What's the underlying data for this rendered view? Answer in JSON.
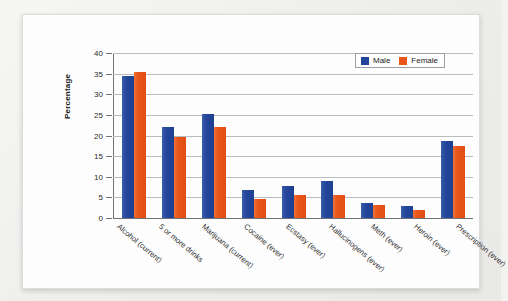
{
  "chart_data": {
    "type": "bar",
    "title": "",
    "xlabel": "",
    "ylabel": "Percentage",
    "ylim": [
      0,
      40
    ],
    "yticks": [
      0,
      5,
      10,
      15,
      20,
      25,
      30,
      35,
      40
    ],
    "grid": true,
    "legend_position": "top-right",
    "categories": [
      "Alcohol (current)",
      "5 or more drinks",
      "Marijuana (current)",
      "Cocaine (ever)",
      "Ecstasy (ever)",
      "Hallucinogens (ever)",
      "Meth (ever)",
      "Heroin (ever)",
      "Prescription (ever)"
    ],
    "series": [
      {
        "name": "Male",
        "color": "#22459a",
        "values": [
          34.4,
          22.0,
          25.1,
          6.7,
          7.7,
          9.0,
          3.6,
          3.0,
          18.6
        ]
      },
      {
        "name": "Female",
        "color": "#e8551a",
        "values": [
          35.5,
          19.7,
          22.0,
          4.7,
          5.6,
          5.7,
          3.2,
          1.9,
          17.5
        ]
      }
    ]
  },
  "legend": {
    "items": [
      {
        "label": "Male",
        "color": "#22459a"
      },
      {
        "label": "Female",
        "color": "#e8551a"
      }
    ]
  }
}
